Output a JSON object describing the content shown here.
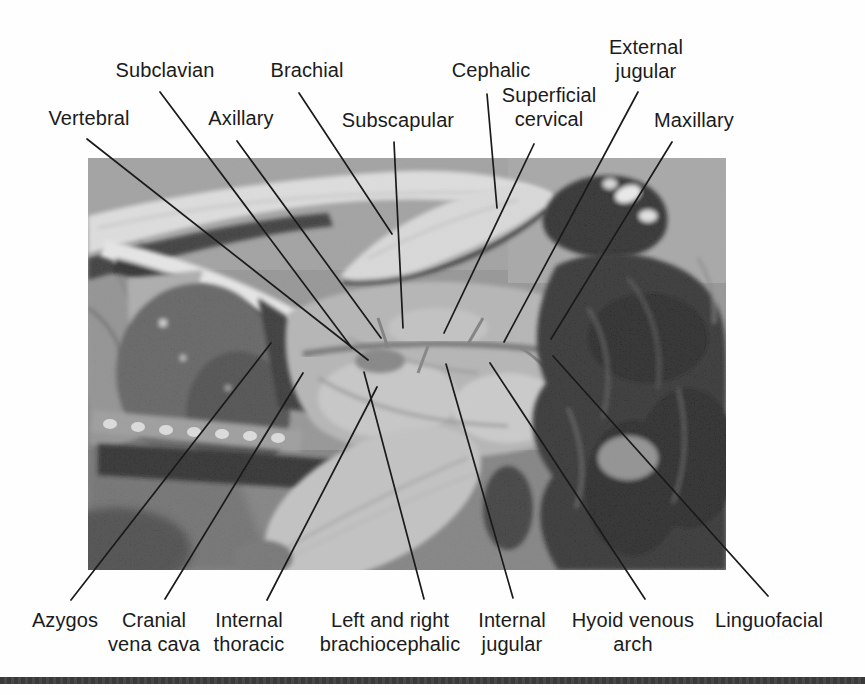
{
  "figure": {
    "kind": "labeled dissection photograph",
    "labels": {
      "vertebral": "Vertebral",
      "subclavian": "Subclavian",
      "axillary": "Axillary",
      "brachial": "Brachial",
      "subscapular": "Subscapular",
      "cephalic": "Cephalic",
      "superficial_cervical": "Superficial\ncervical",
      "external_jugular": "External\njugular",
      "maxillary": "Maxillary",
      "azygos": "Azygos",
      "cranial_vena_cava": "Cranial\nvena cava",
      "internal_thoracic": "Internal\nthoracic",
      "brachiocephalic": "Left and right\nbrachiocephalic",
      "internal_jugular": "Internal\njugular",
      "hyoid_venous_arch": "Hyoid venous\narch",
      "linguofacial": "Linguofacial"
    },
    "colors": {
      "label_text": "#1b1b1b",
      "leader_line": "#1a1a1a",
      "bottom_rule": "#3a3a3a",
      "page_background": "#fefefe",
      "photo_tray_gray": "#8f8f8f"
    }
  }
}
